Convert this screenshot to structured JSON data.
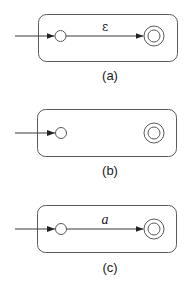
{
  "diagram": {
    "type": "nfa-construction-cases",
    "colors": {
      "stroke": "#5a5a5a",
      "edge": "#3a3a3a",
      "text": "#222222",
      "background": "#ffffff"
    },
    "panels": [
      {
        "id": "a",
        "caption": "(a)",
        "start_state": "start",
        "final_state": "accept",
        "transition": {
          "from": "start",
          "to": "accept",
          "label": "ε"
        }
      },
      {
        "id": "b",
        "caption": "(b)",
        "start_state": "start",
        "final_state": "accept",
        "transition": null
      },
      {
        "id": "c",
        "caption": "(c)",
        "start_state": "start",
        "final_state": "accept",
        "transition": {
          "from": "start",
          "to": "accept",
          "label": "a"
        }
      }
    ]
  }
}
